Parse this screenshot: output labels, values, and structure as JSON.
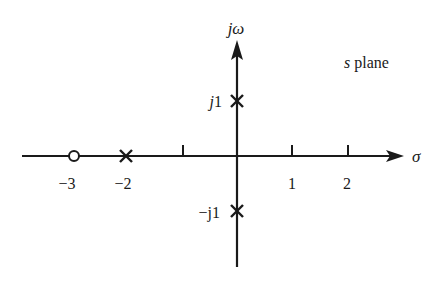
{
  "title": "s plane",
  "axes": {
    "horizontal": {
      "label": "σ",
      "tick_values": [
        -1,
        1,
        2
      ]
    },
    "vertical": {
      "label": "jω"
    }
  },
  "tick_labels": {
    "neg3": "−3",
    "neg2": "−2",
    "pos1": "1",
    "pos2": "2"
  },
  "imag_labels": {
    "pos": {
      "prefix": "j",
      "value": "1"
    },
    "neg": {
      "prefix": "−j",
      "value": "1"
    }
  },
  "poles": [
    {
      "re": -2,
      "im": 0
    },
    {
      "re": 0,
      "im": 1
    },
    {
      "re": 0,
      "im": -1
    }
  ],
  "zeros": [
    {
      "re": -3,
      "im": 0
    }
  ],
  "colors": {
    "ink": "#1a1a1a",
    "background": "#ffffff"
  }
}
